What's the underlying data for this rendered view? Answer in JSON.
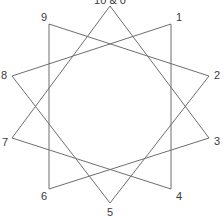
{
  "diagram": {
    "type": "star-polygon",
    "line_color": "#6e6e6e",
    "label_color": "#3a3a3a",
    "vertices": [
      {
        "id": 0,
        "label": "10 & 0",
        "x": 110,
        "y": 6,
        "lx": 110,
        "ly": 4,
        "anchor": "middle"
      },
      {
        "id": 1,
        "label": "1",
        "x": 171,
        "y": 24,
        "lx": 176,
        "ly": 21,
        "anchor": "start"
      },
      {
        "id": 2,
        "label": "2",
        "x": 209,
        "y": 76,
        "lx": 214,
        "ly": 79,
        "anchor": "start"
      },
      {
        "id": 3,
        "label": "3",
        "x": 209,
        "y": 138,
        "lx": 214,
        "ly": 145,
        "anchor": "start"
      },
      {
        "id": 4,
        "label": "4",
        "x": 171,
        "y": 189,
        "lx": 176,
        "ly": 200,
        "anchor": "start"
      },
      {
        "id": 5,
        "label": "5",
        "x": 110,
        "y": 203,
        "lx": 110,
        "ly": 216,
        "anchor": "middle"
      },
      {
        "id": 6,
        "label": "6",
        "x": 49,
        "y": 189,
        "lx": 44,
        "ly": 200,
        "anchor": "middle"
      },
      {
        "id": 7,
        "label": "7",
        "x": 12,
        "y": 138,
        "lx": 5,
        "ly": 146,
        "anchor": "middle"
      },
      {
        "id": 8,
        "label": "8",
        "x": 12,
        "y": 76,
        "lx": 4,
        "ly": 79,
        "anchor": "middle"
      },
      {
        "id": 9,
        "label": "9",
        "x": 49,
        "y": 24,
        "lx": 44,
        "ly": 21,
        "anchor": "middle"
      }
    ],
    "edges": [
      [
        0,
        3
      ],
      [
        3,
        6
      ],
      [
        6,
        9
      ],
      [
        9,
        2
      ],
      [
        2,
        5
      ],
      [
        5,
        8
      ],
      [
        8,
        1
      ],
      [
        1,
        4
      ],
      [
        4,
        7
      ],
      [
        7,
        0
      ]
    ]
  }
}
